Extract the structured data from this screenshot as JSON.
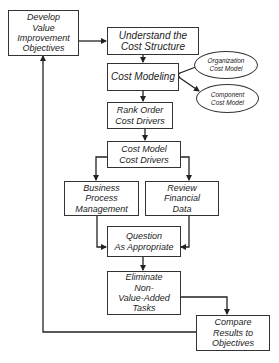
{
  "diagram": {
    "nodes": {
      "develop": {
        "lines": [
          "Develop",
          "Value",
          "Improvement",
          "Objectives"
        ]
      },
      "understand": {
        "lines": [
          "Understand the",
          "Cost Structure"
        ]
      },
      "cost_modeling": {
        "lines": [
          "Cost Modeling"
        ]
      },
      "org_model": {
        "lines": [
          "Organization",
          "Cost Model"
        ]
      },
      "component_model": {
        "lines": [
          "Component",
          "Cost Model"
        ]
      },
      "rank_order": {
        "lines": [
          "Rank Order",
          "Cost Drivers"
        ]
      },
      "cost_model_drivers": {
        "lines": [
          "Cost Model",
          "Cost Drivers"
        ]
      },
      "business_process": {
        "lines": [
          "Business",
          "Process",
          "Management"
        ]
      },
      "review_financial": {
        "lines": [
          "Review",
          "Financial",
          "Data"
        ]
      },
      "question": {
        "lines": [
          "Question",
          "As Appropriate"
        ]
      },
      "eliminate": {
        "lines": [
          "Eliminate",
          "Non-",
          "Value-Added",
          "Tasks"
        ]
      },
      "compare": {
        "lines": [
          "Compare",
          "Results to",
          "Objectives"
        ]
      }
    },
    "edges": [
      [
        "develop",
        "understand"
      ],
      [
        "understand",
        "cost_modeling"
      ],
      [
        "cost_modeling",
        "org_model"
      ],
      [
        "cost_modeling",
        "component_model"
      ],
      [
        "cost_modeling",
        "rank_order"
      ],
      [
        "rank_order",
        "cost_model_drivers"
      ],
      [
        "cost_model_drivers",
        "business_process"
      ],
      [
        "cost_model_drivers",
        "review_financial"
      ],
      [
        "business_process",
        "question"
      ],
      [
        "review_financial",
        "question"
      ],
      [
        "question",
        "eliminate"
      ],
      [
        "eliminate",
        "compare"
      ],
      [
        "compare",
        "develop"
      ]
    ]
  }
}
